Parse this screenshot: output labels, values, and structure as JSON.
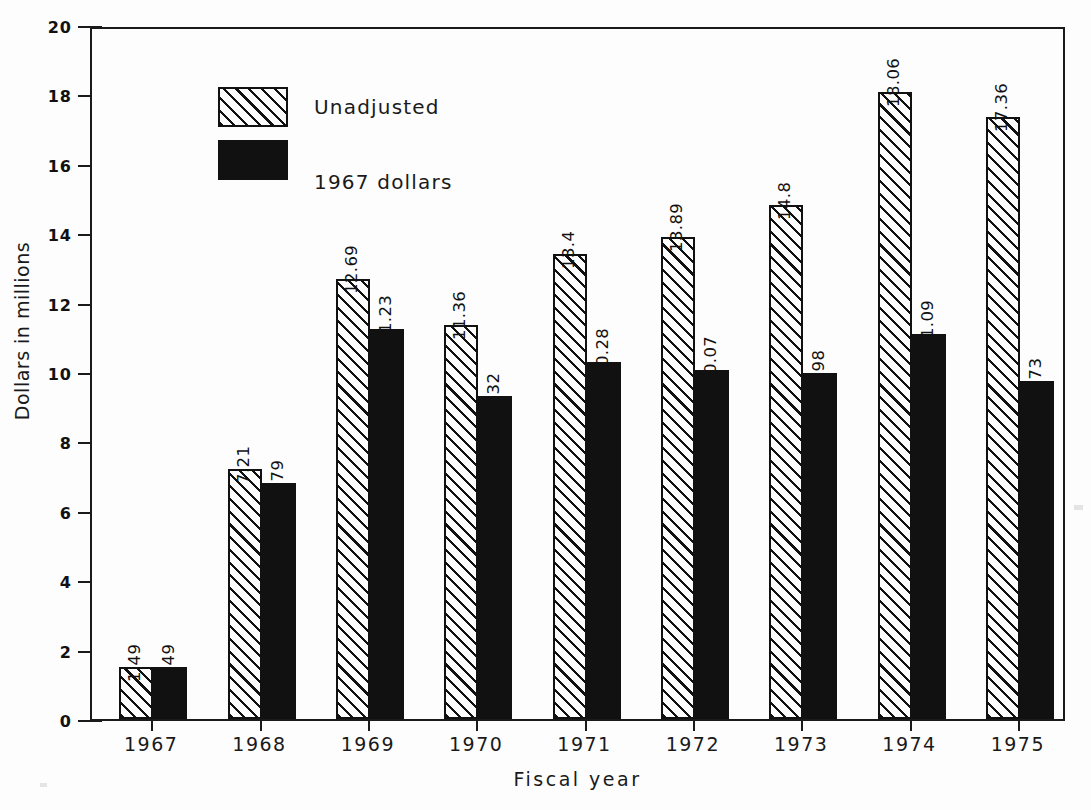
{
  "chart_data": {
    "type": "bar",
    "title": "",
    "xlabel": "Fiscal year",
    "ylabel": "Dollars in millions",
    "categories": [
      "1967",
      "1968",
      "1969",
      "1970",
      "1971",
      "1972",
      "1973",
      "1974",
      "1975"
    ],
    "series": [
      {
        "name": "Unadjusted",
        "style": "hatched",
        "color": "#111111",
        "values": [
          1.49,
          7.21,
          12.69,
          11.36,
          13.4,
          13.89,
          14.8,
          18.06,
          17.36
        ],
        "labels": [
          "1.49",
          "7.21",
          "12.69",
          "11.36",
          "13.4",
          "13.89",
          "14.8",
          "18.06",
          "17.36"
        ]
      },
      {
        "name": "1967 dollars",
        "style": "solid",
        "color": "#111111",
        "values": [
          1.49,
          6.79,
          11.23,
          9.32,
          10.28,
          10.07,
          9.98,
          11.09,
          9.73
        ],
        "labels": [
          "1.49",
          "6.79",
          "11.23",
          "9.32",
          "10.28",
          "10.07",
          "9.98",
          "11.09",
          "9.73"
        ]
      }
    ],
    "ylim": [
      0,
      20
    ],
    "yticks": [
      0,
      2,
      4,
      6,
      8,
      10,
      12,
      14,
      16,
      18,
      20
    ],
    "ytick_labels": [
      "0",
      "2",
      "4",
      "6",
      "8",
      "10",
      "12",
      "14",
      "16",
      "18",
      "20"
    ],
    "grid": false,
    "legend_position": "top-left",
    "value_labels_rotation": 90
  },
  "legend": {
    "items": [
      {
        "label": "Unadjusted",
        "swatch": "hatched-swatch"
      },
      {
        "label": "1967 dollars",
        "swatch": "solid-black-swatch"
      }
    ]
  }
}
